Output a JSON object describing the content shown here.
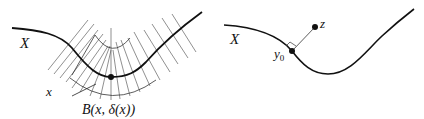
{
  "left_figure": {
    "set_label": "X",
    "point_label": "x",
    "ball_label": "B(x,  δ(x))"
  },
  "right_figure": {
    "set_label": "X",
    "external_point_label": "z",
    "nearest_point_label": "y",
    "nearest_point_subscript": "0"
  },
  "colors": {
    "curve": "#111111",
    "hatch": "#333333"
  }
}
